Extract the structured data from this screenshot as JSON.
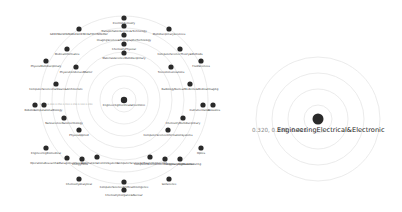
{
  "left_diagram": {
    "center": {
      "label": "EngineeringElectrical&Electronic",
      "x": 124,
      "y": 100
    },
    "rings": [
      12,
      24,
      36,
      48,
      60,
      72,
      84
    ],
    "nodes": [
      {
        "label": "ElectroChemistry",
        "x": 124,
        "y": 18,
        "lx": 124,
        "ly": 24
      },
      {
        "label": "TransportationScience&Technology",
        "x": 124,
        "y": 26,
        "lx": 124,
        "ly": 32
      },
      {
        "label": "ImagingScience&PhotographicTechnology",
        "x": 124,
        "y": 35,
        "lx": 124,
        "ly": 41
      },
      {
        "label": "ChemistryPhysical",
        "x": 124,
        "y": 44,
        "lx": 124,
        "ly": 50
      },
      {
        "label": "MaterialsScienceMultidisciplinary",
        "x": 124,
        "y": 53,
        "lx": 124,
        "ly": 59
      },
      {
        "label": "GREENSUSTAINABLESCIENCE&TECHNOLOGY",
        "x": 79,
        "y": 29,
        "lx": 79,
        "ly": 35
      },
      {
        "label": "MultidisciplinarySciences",
        "x": 169,
        "y": 29,
        "lx": 169,
        "ly": 35
      },
      {
        "label": "MedicalInformatics",
        "x": 67,
        "y": 49,
        "lx": 67,
        "ly": 55
      },
      {
        "label": "ComputerScienceTheory&Methods",
        "x": 180,
        "y": 49,
        "lx": 180,
        "ly": 55
      },
      {
        "label": "PhysicsMultidisciplinary",
        "x": 46,
        "y": 61,
        "lx": 46,
        "ly": 67
      },
      {
        "label": "FluidSciences",
        "x": 201,
        "y": 61,
        "lx": 201,
        "ly": 67
      },
      {
        "label": "PhysicsCondensedMatter",
        "x": 76,
        "y": 67,
        "lx": 76,
        "ly": 73
      },
      {
        "label": "Telecommunications",
        "x": 171,
        "y": 67,
        "lx": 171,
        "ly": 73
      },
      {
        "label": "ComputerScienceHardware&Architecture",
        "x": 56,
        "y": 84,
        "lx": 56,
        "ly": 90
      },
      {
        "label": "RadiologyNuclearMedicine&MedicalImaging",
        "x": 190,
        "y": 84,
        "lx": 190,
        "ly": 90
      },
      {
        "label": "Robotics",
        "x": 35,
        "y": 105,
        "lx": 30,
        "ly": 111
      },
      {
        "label": "ComputationalBiology",
        "x": 44,
        "y": 105,
        "lx": 48,
        "ly": 111
      },
      {
        "label": "Instrumentation",
        "x": 203,
        "y": 105,
        "lx": 200,
        "ly": 111
      },
      {
        "label": "Acoustics",
        "x": 213,
        "y": 105,
        "lx": 214,
        "ly": 111
      },
      {
        "label": "NanoscienceNanotechnology",
        "x": 64,
        "y": 118,
        "lx": 64,
        "ly": 124
      },
      {
        "label": "ChemistryMultidisciplinary",
        "x": 183,
        "y": 118,
        "lx": 183,
        "ly": 124
      },
      {
        "label": "PhysicsApplied",
        "x": 79,
        "y": 130,
        "lx": 79,
        "ly": 136
      },
      {
        "label": "ComputerScienceInformationSystems",
        "x": 168,
        "y": 130,
        "lx": 168,
        "ly": 136
      },
      {
        "label": "EngineeringBiomedical",
        "x": 46,
        "y": 148,
        "lx": 46,
        "ly": 154
      },
      {
        "label": "Optics",
        "x": 201,
        "y": 148,
        "lx": 201,
        "ly": 154
      },
      {
        "label": "OperationsResearch&ManagementScience",
        "x": 67,
        "y": 158,
        "lx": 58,
        "ly": 164
      },
      {
        "label": "EnergyFuels",
        "x": 82,
        "y": 159,
        "lx": 80,
        "ly": 165
      },
      {
        "label": "Automation&ControlSystems",
        "x": 97,
        "y": 157,
        "lx": 100,
        "ly": 164
      },
      {
        "label": "ComputerScienceSoftwareEngineering",
        "x": 150,
        "y": 157,
        "lx": 142,
        "ly": 164
      },
      {
        "label": "ComputerScienceInterdisciplinaryApplications",
        "x": 165,
        "y": 159,
        "lx": 164,
        "ly": 165
      },
      {
        "label": "EngineeringManufacturing",
        "x": 180,
        "y": 159,
        "lx": 184,
        "ly": 165
      },
      {
        "label": "ChemistryAnalytical",
        "x": 79,
        "y": 179,
        "lx": 79,
        "ly": 185
      },
      {
        "label": "SoilScience",
        "x": 169,
        "y": 179,
        "lx": 169,
        "ly": 185
      },
      {
        "label": "ComputerScienceArtificialIntelligence",
        "x": 124,
        "y": 182,
        "lx": 124,
        "ly": 188
      },
      {
        "label": "ChemistryInorganic&Nuclear",
        "x": 124,
        "y": 190,
        "lx": 124,
        "ly": 196
      }
    ],
    "axis_ticks": "0.320 0.300 0.250 0.200 0.150 0.100 0.050"
  },
  "right_diagram": {
    "focus_label": "EngineeringElectrical&Electronic",
    "values_label": "0.320, 0.300, 0.411",
    "rings": [
      14,
      30,
      46,
      62
    ]
  }
}
